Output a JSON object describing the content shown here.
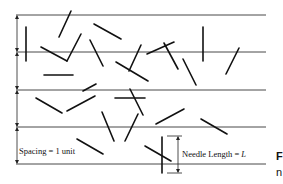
{
  "diagram": {
    "spacing_label": "Spacing = 1 unit",
    "needle_label": "Needle Length = ",
    "needle_symbol": "L",
    "caption_fragment_1": "F",
    "caption_fragment_2": "n",
    "parallel_line_count": 5,
    "needle_count": 25
  }
}
